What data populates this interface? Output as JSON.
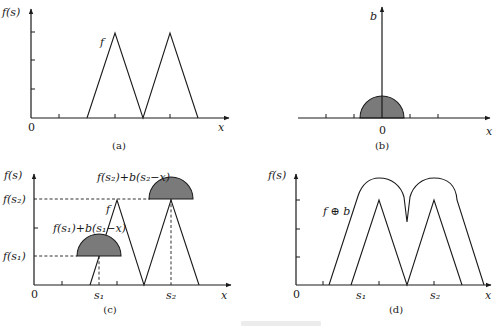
{
  "figure": {
    "panels": [
      {
        "id": "a",
        "caption": "(a)",
        "y_axis_label": "f(s)",
        "x_axis_label": "x",
        "origin_label": "0",
        "curve_label": "f",
        "description": "Grayscale function f composed of two triangular peaks"
      },
      {
        "id": "b",
        "caption": "(b)",
        "y_axis_label": "b",
        "x_axis_label": "x",
        "origin_label": "0",
        "description": "Hemispherical (semicircular) structuring element b centered at origin"
      },
      {
        "id": "c",
        "caption": "(c)",
        "y_axis_label": "f(s)",
        "x_axis_label": "x",
        "origin_label": "0",
        "curve_label": "f",
        "level_labels": {
          "fs2": "f(s₂)",
          "fs1": "f(s₁)"
        },
        "sample_labels": {
          "s1": "s₁",
          "s2": "s₂"
        },
        "annotations": {
          "upper": "f(s₂)+b(s₂−x)",
          "lower": "f(s₁)+b(s₁−x)"
        },
        "description": "Structuring element placed at points s1 and s2 on f"
      },
      {
        "id": "d",
        "caption": "(d)",
        "y_axis_label": "f(s)",
        "x_axis_label": "x",
        "origin_label": "0",
        "curve_label": "f ⊕ b",
        "sample_labels": {
          "s1": "s₁",
          "s2": "s₂"
        },
        "description": "Grayscale dilation result f ⊕ b enveloping f"
      }
    ],
    "colors": {
      "line": "#1a1a1a",
      "fill": "#7a7a7a",
      "background": "#ffffff"
    }
  }
}
